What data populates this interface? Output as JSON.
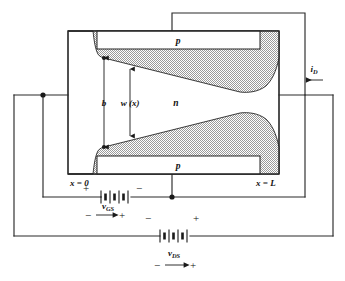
{
  "figure": {
    "type": "semiconductor-device-diagram"
  },
  "device": {
    "gate_top_label": "p",
    "gate_bottom_label": "p",
    "channel_label": "n",
    "source_coordinate_label": "x = 0",
    "drain_coordinate_label": "x = L"
  },
  "dimensions": {
    "channel_half_width_label": "b",
    "depletion_width_label": "w (x)"
  },
  "current": {
    "drain_current_label": "i",
    "drain_current_subscript": "D",
    "drain_current_direction": "left"
  },
  "sources": {
    "gate_source": {
      "label": "v",
      "subscript": "GS",
      "terminal_left": "+",
      "terminal_right": "−",
      "polarity_arrow_left": "−",
      "polarity_arrow_right": "+"
    },
    "drain_source": {
      "label": "v",
      "subscript": "DS",
      "terminal_left": "−",
      "terminal_right": "+",
      "polarity_arrow_left": "−",
      "polarity_arrow_right": "+"
    }
  },
  "colors": {
    "line": "#2b2b2b",
    "depletion_fill": "#c9c9c9",
    "background": "#ffffff",
    "text": "#111111"
  }
}
